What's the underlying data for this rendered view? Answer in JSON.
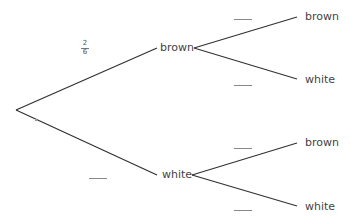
{
  "header": {
    "partial_text": "...pulled from a bag with brown and white counters..."
  },
  "tree": {
    "first_stage": {
      "branches": [
        {
          "outcome": "brown",
          "probability": {
            "numerator": "2",
            "denominator": "6"
          }
        },
        {
          "outcome": "white",
          "probability": ""
        }
      ]
    },
    "second_stage": {
      "after_brown": [
        {
          "outcome": "brown",
          "probability": ""
        },
        {
          "outcome": "white",
          "probability": ""
        }
      ],
      "after_white": [
        {
          "outcome": "brown",
          "probability": ""
        },
        {
          "outcome": "white",
          "probability": ""
        }
      ]
    }
  },
  "colors": {
    "line": "#333333",
    "text": "#444444",
    "blank": "#888888"
  }
}
